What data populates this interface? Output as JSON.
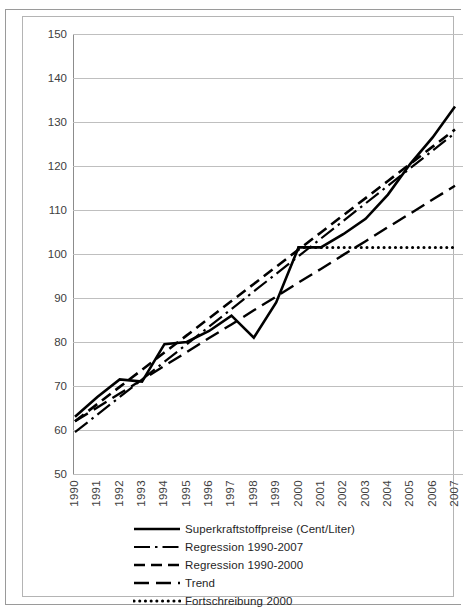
{
  "figure": {
    "frame_border_color": "#b4b4b4",
    "background": "#ffffff"
  },
  "caption_sliver": "",
  "chart_data": {
    "type": "line",
    "title": "",
    "subtitle": "",
    "xlabel": "",
    "ylabel": "",
    "grid": true,
    "legend_position": "bottom",
    "x": [
      1990,
      1991,
      1992,
      1993,
      1994,
      1995,
      1996,
      1997,
      1998,
      1999,
      2000,
      2001,
      2002,
      2003,
      2004,
      2005,
      2006,
      2007
    ],
    "categories": [
      "1990",
      "1991",
      "1992",
      "1993",
      "1994",
      "1995",
      "1996",
      "1997",
      "1998",
      "1999",
      "2000",
      "2001",
      "2002",
      "2003",
      "2004",
      "2005",
      "2006",
      "2007"
    ],
    "xlim": [
      1990,
      2007
    ],
    "ylim": [
      50,
      150
    ],
    "yticks": [
      50,
      60,
      70,
      80,
      90,
      100,
      110,
      120,
      130,
      140,
      150
    ],
    "series": [
      {
        "name": "Superkraftstoffpreise (Cent/Liter)",
        "style": "solid",
        "color": "#000000",
        "width": 2.6,
        "values": [
          63.0,
          67.5,
          71.5,
          71.0,
          79.5,
          80.0,
          82.5,
          86.0,
          81.0,
          89.0,
          101.5,
          101.5,
          104.5,
          108.0,
          113.5,
          120.5,
          126.5,
          133.5
        ]
      },
      {
        "name": "Regression 1990-2007",
        "style": "dash-dot",
        "color": "#000000",
        "width": 2.2,
        "values": [
          59.5,
          63.5,
          67.5,
          71.5,
          75.5,
          79.5,
          83.5,
          87.5,
          91.5,
          95.5,
          99.5,
          103.5,
          107.5,
          111.5,
          115.5,
          119.5,
          123.5,
          127.5
        ]
      },
      {
        "name": "Regression 1990-2000",
        "style": "dashed",
        "color": "#000000",
        "width": 2.6,
        "values": [
          62.0,
          65.9,
          69.8,
          73.7,
          77.6,
          81.5,
          85.4,
          89.3,
          93.2,
          97.1,
          101.0,
          104.9,
          108.8,
          112.7,
          116.6,
          120.5,
          124.4,
          128.3
        ]
      },
      {
        "name": "Trend",
        "style": "long-dash",
        "color": "#000000",
        "width": 2.4,
        "values": [
          62.0,
          65.1,
          68.3,
          71.4,
          74.6,
          77.7,
          80.9,
          84.0,
          87.2,
          90.3,
          93.5,
          96.6,
          99.8,
          102.9,
          106.1,
          109.2,
          112.4,
          115.5
        ]
      },
      {
        "name": "Fortschreibung 2000",
        "style": "dotted",
        "color": "#000000",
        "width": 3.0,
        "start_year": 2000,
        "values": [
          null,
          null,
          null,
          null,
          null,
          null,
          null,
          null,
          null,
          null,
          101.5,
          101.5,
          101.5,
          101.5,
          101.5,
          101.5,
          101.5,
          101.5
        ]
      }
    ]
  },
  "legend": {
    "items": [
      {
        "label": "Superkraftstoffpreise (Cent/Liter)",
        "style": "solid"
      },
      {
        "label": "Regression 1990-2007",
        "style": "dash-dot"
      },
      {
        "label": "Regression 1990-2000",
        "style": "dashed"
      },
      {
        "label": "Trend",
        "style": "long-dash"
      },
      {
        "label": "Fortschreibung 2000",
        "style": "dotted"
      }
    ]
  }
}
